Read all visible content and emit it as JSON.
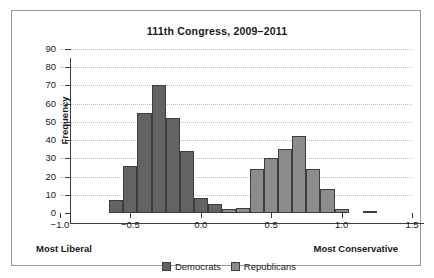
{
  "chart_data": {
    "type": "bar",
    "title": "111th Congress, 2009–2011",
    "xlabel": "",
    "ylabel": "Frequency",
    "xlim": [
      -1.0,
      1.5
    ],
    "ylim": [
      0,
      90
    ],
    "ytick_labels": [
      "0",
      "10",
      "20",
      "30",
      "40",
      "50",
      "60",
      "70",
      "80",
      "90"
    ],
    "ytick_values": [
      0,
      10,
      20,
      30,
      40,
      50,
      60,
      70,
      80,
      90
    ],
    "xtick_labels": [
      "−1.0",
      "−0.5",
      "0.0",
      "0.5",
      "1.0",
      "1.5"
    ],
    "xtick_values": [
      -1.0,
      -0.5,
      0.0,
      0.5,
      1.0,
      1.5
    ],
    "grid": true,
    "legend_position": "bottom",
    "bin_width": 0.1,
    "axis_annotations": {
      "left": "Most Liberal",
      "right": "Most Conservative"
    },
    "series": [
      {
        "name": "Democrats",
        "color": "#636363",
        "bins": [
          {
            "x0": -0.65,
            "x1": -0.55,
            "value": 7
          },
          {
            "x0": -0.55,
            "x1": -0.45,
            "value": 26
          },
          {
            "x0": -0.45,
            "x1": -0.35,
            "value": 55
          },
          {
            "x0": -0.35,
            "x1": -0.25,
            "value": 70
          },
          {
            "x0": -0.25,
            "x1": -0.15,
            "value": 52
          },
          {
            "x0": -0.15,
            "x1": -0.05,
            "value": 34
          },
          {
            "x0": -0.05,
            "x1": 0.05,
            "value": 8
          },
          {
            "x0": 0.05,
            "x1": 0.15,
            "value": 5
          }
        ]
      },
      {
        "name": "Republicans",
        "color": "#8c8c8c",
        "bins": [
          {
            "x0": 0.15,
            "x1": 0.25,
            "value": 2
          },
          {
            "x0": 0.25,
            "x1": 0.35,
            "value": 3
          },
          {
            "x0": 0.35,
            "x1": 0.45,
            "value": 24
          },
          {
            "x0": 0.45,
            "x1": 0.55,
            "value": 30
          },
          {
            "x0": 0.55,
            "x1": 0.65,
            "value": 35
          },
          {
            "x0": 0.65,
            "x1": 0.75,
            "value": 42
          },
          {
            "x0": 0.75,
            "x1": 0.85,
            "value": 24
          },
          {
            "x0": 0.85,
            "x1": 0.95,
            "value": 13
          },
          {
            "x0": 0.95,
            "x1": 1.05,
            "value": 2
          },
          {
            "x0": 1.15,
            "x1": 1.25,
            "value": 1
          }
        ]
      }
    ]
  },
  "legend": [
    {
      "label": "Democrats",
      "color": "#636363"
    },
    {
      "label": "Republicans",
      "color": "#8c8c8c"
    }
  ]
}
